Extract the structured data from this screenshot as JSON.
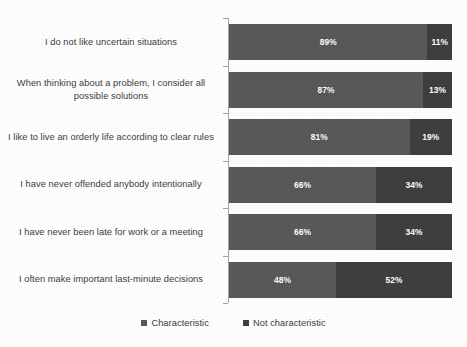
{
  "chart_data": {
    "type": "bar",
    "subtype": "horizontal-stacked-100",
    "title": "",
    "subtitle": "",
    "xlabel": "",
    "ylabel": "",
    "xlim": [
      0,
      100
    ],
    "grid": false,
    "legend_position": "bottom-center",
    "categories": [
      "I do not like uncertain situations",
      "When thinking about a problem, I consider all possible solutions",
      "I like to live an orderly life according to clear rules",
      "I have never offended anybody intentionally",
      "I have never been late for work or a meeting",
      "I often make important last-minute decisions"
    ],
    "series": [
      {
        "name": "Characteristic",
        "color": "#595959",
        "values": [
          89,
          87,
          81,
          66,
          66,
          48
        ],
        "labels": [
          "89%",
          "87%",
          "81%",
          "66%",
          "66%",
          "48%"
        ]
      },
      {
        "name": "Not characteristic",
        "color": "#3f3f3f",
        "values": [
          11,
          13,
          19,
          34,
          34,
          52
        ],
        "labels": [
          "11%",
          "13%",
          "19%",
          "34%",
          "34%",
          "52%"
        ]
      }
    ]
  },
  "axis": {
    "line_color": "#a6a6a6",
    "tick_count": 7
  },
  "legend": {
    "items": [
      {
        "label": "Characteristic",
        "color": "#595959",
        "marker": "square-marker"
      },
      {
        "label": "Not characteristic",
        "color": "#3f3f3f",
        "marker": "square-marker"
      }
    ]
  }
}
